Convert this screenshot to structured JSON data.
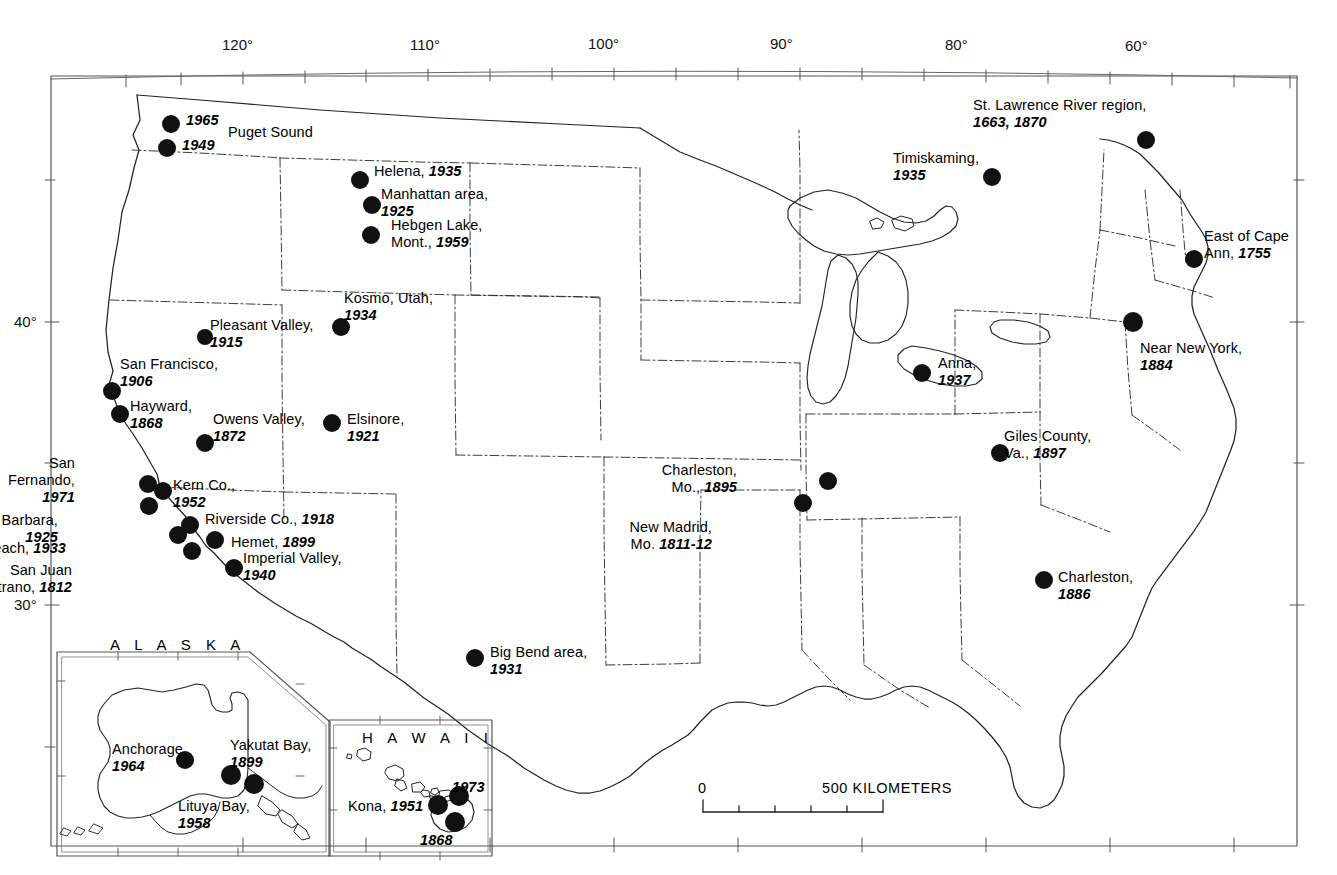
{
  "map": {
    "title": "Map of United States seismicity — notable historic earthquakes",
    "frame": {
      "left": 51,
      "top": 76,
      "right": 1297,
      "bottom": 846
    },
    "graticule": {
      "longitude_labels": [
        "120°",
        "110°",
        "100°",
        "90°",
        "80°",
        "60°"
      ],
      "latitude_labels": [
        "40°",
        "30°"
      ]
    },
    "scale_bar": {
      "zero_label": "0",
      "max_label": "500 KILOMETERS",
      "divisions": 5
    },
    "insets": [
      {
        "name": "ALASKA",
        "label": "A L A S K A"
      },
      {
        "name": "HAWAII",
        "label": "H A W A I I"
      }
    ]
  },
  "events": [
    {
      "name": "Puget Sound 1965",
      "place": "",
      "year": "1965",
      "lines": [
        "1965"
      ],
      "align": "left",
      "lx": 186,
      "ly": 112,
      "dx": 171,
      "dy": 124
    },
    {
      "name": "Puget Sound 1949",
      "place": "",
      "year": "1949",
      "lines": [
        "1949"
      ],
      "align": "left",
      "lx": 182,
      "ly": 137,
      "dx": 167,
      "dy": 148
    },
    {
      "name": "Puget Sound",
      "place": "Puget Sound",
      "year": "",
      "lines": [
        "Puget Sound"
      ],
      "align": "left",
      "lx": 228,
      "ly": 124,
      "dx": null,
      "dy": null
    },
    {
      "name": "Helena",
      "place": "Helena,",
      "year": "1935",
      "lines": [
        "Helena, 1935"
      ],
      "align": "left",
      "lx": 374,
      "ly": 163,
      "dx": 360,
      "dy": 180
    },
    {
      "name": "Manhattan area",
      "place": "Manhattan area,",
      "year": "1925",
      "lines": [
        "Manhattan area,",
        "1925"
      ],
      "align": "left",
      "lx": 381,
      "ly": 186,
      "dx": 372,
      "dy": 205
    },
    {
      "name": "Hebgen Lake",
      "place": "Hebgen Lake, Mont.,",
      "year": "1959",
      "lines": [
        "Hebgen Lake,",
        "Mont., 1959"
      ],
      "align": "left",
      "lx": 391,
      "ly": 217,
      "dx": 371,
      "dy": 235
    },
    {
      "name": "Kosmo Utah",
      "place": "Kosmo, Utah,",
      "year": "1934",
      "lines": [
        "Kosmo, Utah,",
        "1934"
      ],
      "align": "left",
      "lx": 344,
      "ly": 290,
      "dx": 341,
      "dy": 327
    },
    {
      "name": "Pleasant Valley",
      "place": "Pleasant Valley,",
      "year": "1915",
      "lines": [
        "Pleasant Valley,",
        "1915"
      ],
      "align": "left",
      "lx": 210,
      "ly": 317,
      "dx": 205,
      "dy": 337
    },
    {
      "name": "San Francisco",
      "place": "San Francisco,",
      "year": "1906",
      "lines": [
        "San Francisco,",
        "1906"
      ],
      "align": "left",
      "lx": 120,
      "ly": 356,
      "dx": 112,
      "dy": 391
    },
    {
      "name": "Hayward",
      "place": "Hayward,",
      "year": "1868",
      "lines": [
        "Hayward,",
        "1868"
      ],
      "align": "left",
      "lx": 130,
      "ly": 398,
      "dx": 120,
      "dy": 414
    },
    {
      "name": "Owens Valley",
      "place": "Owens Valley,",
      "year": "1872",
      "lines": [
        "Owens Valley,",
        "1872"
      ],
      "align": "left",
      "lx": 213,
      "ly": 411,
      "dx": 205,
      "dy": 443
    },
    {
      "name": "Elsinore",
      "place": "Elsinore,",
      "year": "1921",
      "lines": [
        "Elsinore,",
        "1921"
      ],
      "align": "left",
      "lx": 347,
      "ly": 411,
      "dx": 332,
      "dy": 423
    },
    {
      "name": "San Fernando",
      "place": "San Fernando,",
      "year": "1971",
      "lines": [
        "San",
        "Fernando,",
        "1971"
      ],
      "align": "right",
      "lx": 75,
      "ly": 455,
      "dx": 148,
      "dy": 484
    },
    {
      "name": "Kern Co",
      "place": "Kern Co.,",
      "year": "1952",
      "lines": [
        "Kern Co.,",
        "1952"
      ],
      "align": "left",
      "lx": 173,
      "ly": 477,
      "dx": 163,
      "dy": 491
    },
    {
      "name": "Santa Barbara",
      "place": "Santa Barbara,",
      "year": "1925",
      "lines": [
        "Santa Barbara,",
        "1925"
      ],
      "align": "right",
      "lx": 58,
      "ly": 512,
      "dx": 149,
      "dy": 506
    },
    {
      "name": "Riverside Co",
      "place": "Riverside Co.,",
      "year": "1918",
      "lines": [
        "Riverside Co., 1918"
      ],
      "align": "left",
      "lx": 205,
      "ly": 511,
      "dx": 190,
      "dy": 525
    },
    {
      "name": "Long Beach",
      "place": "Long Beach,",
      "year": "1933",
      "lines": [
        "Long Beach, 1933"
      ],
      "align": "right",
      "lx": 66,
      "ly": 540,
      "dx": 178,
      "dy": 535
    },
    {
      "name": "Hemet",
      "place": "Hemet,",
      "year": "1899",
      "lines": [
        "Hemet, 1899"
      ],
      "align": "left",
      "lx": 231,
      "ly": 534,
      "dx": 215,
      "dy": 540
    },
    {
      "name": "Imperial Valley",
      "place": "Imperial Valley,",
      "year": "1940",
      "lines": [
        "Imperial Valley,",
        "1940"
      ],
      "align": "left",
      "lx": 243,
      "ly": 550,
      "dx": 234,
      "dy": 568
    },
    {
      "name": "San Juan Capistrano",
      "place": "San Juan Capistrano,",
      "year": "1812",
      "lines": [
        "San Juan",
        "Capistrano, 1812"
      ],
      "align": "right",
      "lx": 72,
      "ly": 562,
      "dx": 192,
      "dy": 551
    },
    {
      "name": "Big Bend area",
      "place": "Big Bend area,",
      "year": "1931",
      "lines": [
        "Big Bend area,",
        "1931"
      ],
      "align": "left",
      "lx": 490,
      "ly": 644,
      "dx": 475,
      "dy": 658
    },
    {
      "name": "New Madrid",
      "place": "New Madrid, Mo.",
      "year": "1811-12",
      "lines": [
        "New Madrid,",
        "Mo. 1811-12"
      ],
      "align": "right",
      "lx": 712,
      "ly": 519,
      "dx": 803,
      "dy": 503
    },
    {
      "name": "Charleston Mo",
      "place": "Charleston, Mo.,",
      "year": "1895",
      "lines": [
        "Charleston,",
        "Mo., 1895"
      ],
      "align": "right",
      "lx": 737,
      "ly": 462,
      "dx": 828,
      "dy": 481
    },
    {
      "name": "Anna",
      "place": "Anna,",
      "year": "1937",
      "lines": [
        "Anna,",
        "1937"
      ],
      "align": "left",
      "lx": 938,
      "ly": 355,
      "dx": 922,
      "dy": 373
    },
    {
      "name": "Giles County Va",
      "place": "Giles County, Va.,",
      "year": "1897",
      "lines": [
        "Giles County,",
        "Va., 1897"
      ],
      "align": "left",
      "lx": 1004,
      "ly": 428,
      "dx": 1000,
      "dy": 453
    },
    {
      "name": "Charleston SC",
      "place": "Charleston,",
      "year": "1886",
      "lines": [
        "Charleston,",
        "1886"
      ],
      "align": "left",
      "lx": 1058,
      "ly": 569,
      "dx": 1044,
      "dy": 580
    },
    {
      "name": "Timiskaming",
      "place": "Timiskaming,",
      "year": "1935",
      "lines": [
        "Timiskaming,",
        "1935"
      ],
      "align": "left",
      "lx": 893,
      "ly": 150,
      "dx": 992,
      "dy": 177
    },
    {
      "name": "St Lawrence River region",
      "place": "St. Lawrence River region,",
      "year": "1663, 1870",
      "lines": [
        "St. Lawrence River region,",
        "1663, 1870"
      ],
      "align": "left",
      "lx": 973,
      "ly": 97,
      "dx": 1146,
      "dy": 140
    },
    {
      "name": "East of Cape Ann",
      "place": "East of Cape Ann,",
      "year": "1755",
      "lines": [
        "East of Cape",
        "Ann, 1755"
      ],
      "align": "left",
      "lx": 1204,
      "ly": 228,
      "dx": 1194,
      "dy": 259
    },
    {
      "name": "Near New York",
      "place": "Near New York,",
      "year": "1884",
      "lines": [
        "Near New York,",
        "1884"
      ],
      "align": "left",
      "lx": 1140,
      "ly": 340,
      "dx": 1133,
      "dy": 322
    },
    {
      "name": "Anchorage",
      "place": "Anchorage,",
      "year": "1964",
      "lines": [
        "Anchorage,",
        "1964"
      ],
      "align": "left",
      "lx": 112,
      "ly": 741,
      "dx": 185,
      "dy": 760
    },
    {
      "name": "Yakutat Bay",
      "place": "Yakutat Bay,",
      "year": "1899",
      "lines": [
        "Yakutat Bay,",
        "1899"
      ],
      "align": "left",
      "lx": 230,
      "ly": 737,
      "dx": 231,
      "dy": 775
    },
    {
      "name": "Lituya Bay",
      "place": "Lituya Bay,",
      "year": "1958",
      "lines": [
        "Lituya Bay,",
        "1958"
      ],
      "align": "left",
      "lx": 178,
      "ly": 798,
      "dx": 254,
      "dy": 784
    },
    {
      "name": "Kona",
      "place": "Kona,",
      "year": "1951",
      "lines": [
        "Kona, 1951"
      ],
      "align": "left",
      "lx": 348,
      "ly": 798,
      "dx": 438,
      "dy": 805
    },
    {
      "name": "Hawaii 1973",
      "place": "",
      "year": "1973",
      "lines": [
        "1973"
      ],
      "align": "left",
      "lx": 452,
      "ly": 779,
      "dx": 459,
      "dy": 796
    },
    {
      "name": "Hawaii 1868",
      "place": "",
      "year": "1868",
      "lines": [
        "1868"
      ],
      "align": "left",
      "lx": 420,
      "ly": 832,
      "dx": 455,
      "dy": 822
    }
  ]
}
